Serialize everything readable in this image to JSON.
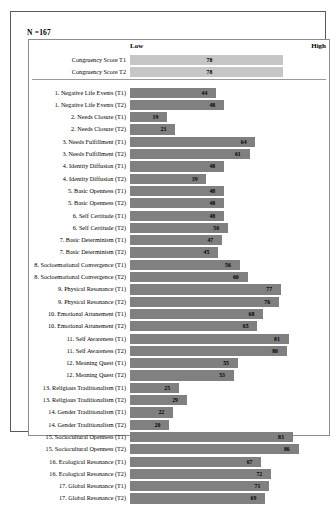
{
  "figure": {
    "n_label": "N =167",
    "axis_low_label": "Low",
    "axis_high_label": "High"
  },
  "chart_data": {
    "type": "bar",
    "orientation": "horizontal",
    "title": "",
    "subtitle": "N =167",
    "xlabel": "",
    "ylabel": "",
    "xlim": [
      0,
      100
    ],
    "axis_tick_labels": [
      "Low",
      "High"
    ],
    "grid": false,
    "legend": "none",
    "colors": {
      "summary_bar": "#c6c6c6",
      "item_bar": "#808080",
      "frame": "#5a5a5a",
      "plot_frame": "#8c8c8c"
    },
    "groups": [
      {
        "name": "summary",
        "style": "light",
        "categories": [
          "Congruency Score T1",
          "Congruency Score T2"
        ],
        "values": [
          78,
          78
        ]
      },
      {
        "name": "items",
        "style": "dark",
        "categories": [
          "1. Negative Life Events (T1)",
          "1. Negative Life Events (T2)",
          "2. Needs Closure (T1)",
          "2. Needs Closure (T2)",
          "3. Needs Fulfillment (T1)",
          "3. Needs Fulfillment (T2)",
          "4. Identity Diffusion (T1)",
          "4. Identity Diffusion (T2)",
          "5. Basic Openness (T1)",
          "5. Basic Openness (T2)",
          "6. Self Certitude (T1)",
          "6. Self Certitude (T2)",
          "7. Basic Determinism (T1)",
          "7. Basic Determinism (T2)",
          "8. Socioemotional Convergence (T1)",
          "8. Socioemotional Convergence (T2)",
          "9. Physical Resonance (T1)",
          "9. Physical Resonance (T2)",
          "10. Emotional Attunement (T1)",
          "10. Emotional Attunement (T2)",
          "11. Self Awareness (T1)",
          "11. Self Awareness (T2)",
          "12. Meaning Quest (T1)",
          "12. Meaning Quest (T2)",
          "13. Religious Traditionalism (T1)",
          "13. Religious Traditionalism (T2)",
          "14. Gender Traditionalism (T1)",
          "14. Gender Traditionalism (T2)",
          "15. Sociocultural Openness (T1)",
          "15. Sociocultural Openness (T2)",
          "16. Ecological Resonance (T1)",
          "16. Ecological Resonance (T2)",
          "17. Global Resonance (T1)",
          "17. Global Resonance (T2)"
        ],
        "values": [
          44,
          48,
          19,
          23,
          64,
          61,
          48,
          39,
          48,
          48,
          48,
          50,
          47,
          45,
          56,
          60,
          77,
          76,
          68,
          65,
          81,
          80,
          55,
          53,
          25,
          29,
          22,
          20,
          83,
          86,
          67,
          72,
          71,
          69
        ]
      }
    ]
  }
}
